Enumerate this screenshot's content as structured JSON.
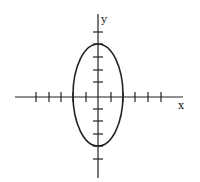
{
  "diagram": {
    "type": "ellipse-on-axes",
    "x_axis_label": "x",
    "y_axis_label": "y",
    "ellipse": {
      "center": [
        0,
        0
      ],
      "semi_axis_x": 2,
      "semi_axis_y": 4
    },
    "x_ticks": [
      -5,
      -4,
      -3,
      -2,
      -1,
      1,
      2,
      3,
      4,
      5
    ],
    "y_ticks": [
      5,
      4,
      3,
      2,
      1,
      -1,
      -2,
      -3,
      -4,
      -5
    ],
    "stroke_color": "#222222"
  }
}
